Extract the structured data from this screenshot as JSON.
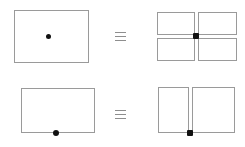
{
  "diagram": {
    "title": "Rectangle subdivision equivalence diagram",
    "colors": {
      "outline": "#9a9a9a",
      "marker": "#111111",
      "symbol": "#8e8e8e",
      "background": "#ffffff"
    },
    "relation_symbol": "≡",
    "relation_symbol_name": "identical-to-triple-bar",
    "rows": [
      {
        "id": "row-top",
        "label": "interior point subdivision",
        "relation": "≡",
        "left": {
          "label": "rectangle with interior marked point",
          "shape": "rectangle",
          "marker_position": "center-interior",
          "piece_count": 1,
          "x": 14,
          "y": 10,
          "width": 75,
          "height": 53,
          "marker": {
            "x": 48,
            "y": 36,
            "size": 5,
            "style": "round"
          }
        },
        "right": {
          "label": "four rectangles in two-by-two grid",
          "shape": "grid",
          "marker_position": "shared-inner-corner",
          "piece_count": 4,
          "rows": 2,
          "cols": 2,
          "x": 157,
          "y": 12,
          "width": 80,
          "height": 49,
          "gap": 3,
          "marker": {
            "x": 196,
            "y": 36,
            "size": 5,
            "style": "square"
          }
        }
      },
      {
        "id": "row-bottom",
        "label": "boundary point subdivision",
        "relation": "≡",
        "left": {
          "label": "rectangle with marked point on bottom edge",
          "shape": "rectangle",
          "marker_position": "bottom-edge",
          "piece_count": 1,
          "x": 21,
          "y": 88,
          "width": 74,
          "height": 45,
          "marker": {
            "x": 56,
            "y": 133,
            "size": 6,
            "style": "round"
          }
        },
        "right": {
          "label": "two rectangles side by side",
          "shape": "grid",
          "marker_position": "shared-bottom-corner",
          "piece_count": 2,
          "rows": 1,
          "cols": 2,
          "x": 158,
          "y": 87,
          "width": 77,
          "height": 46,
          "gap": 3,
          "marker": {
            "x": 190,
            "y": 133,
            "size": 6,
            "style": "square"
          }
        }
      }
    ],
    "symbols": [
      {
        "name": "equivalence-symbol-top",
        "char": "≡",
        "x": 115,
        "y": 31
      },
      {
        "name": "equivalence-symbol-bottom",
        "char": "≡",
        "x": 115,
        "y": 109
      }
    ]
  }
}
